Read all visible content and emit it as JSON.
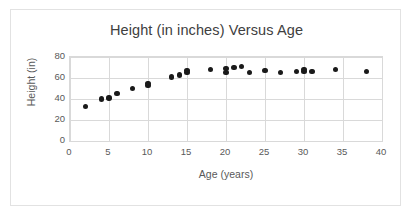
{
  "chart_data": {
    "type": "scatter",
    "title": "Height (in inches) Versus Age",
    "xlabel": "Age (years)",
    "ylabel": "Height (in)",
    "xlim": [
      0,
      40
    ],
    "ylim": [
      0,
      80
    ],
    "xticks": [
      0,
      5,
      10,
      15,
      20,
      25,
      30,
      35,
      40
    ],
    "yticks": [
      0,
      20,
      40,
      60,
      80
    ],
    "grid": true,
    "legend": false,
    "point_color": "#1a1a1a",
    "series": [
      {
        "name": "Height vs Age",
        "points": [
          {
            "x": 2,
            "y": 33
          },
          {
            "x": 4,
            "y": 40
          },
          {
            "x": 5,
            "y": 41
          },
          {
            "x": 6,
            "y": 45
          },
          {
            "x": 8,
            "y": 50
          },
          {
            "x": 10,
            "y": 53
          },
          {
            "x": 10,
            "y": 55
          },
          {
            "x": 13,
            "y": 61
          },
          {
            "x": 14,
            "y": 63
          },
          {
            "x": 15,
            "y": 65
          },
          {
            "x": 15,
            "y": 67
          },
          {
            "x": 18,
            "y": 68
          },
          {
            "x": 20,
            "y": 65
          },
          {
            "x": 20,
            "y": 69
          },
          {
            "x": 21,
            "y": 70
          },
          {
            "x": 22,
            "y": 71
          },
          {
            "x": 23,
            "y": 65
          },
          {
            "x": 25,
            "y": 67
          },
          {
            "x": 27,
            "y": 65
          },
          {
            "x": 29,
            "y": 66
          },
          {
            "x": 30,
            "y": 66
          },
          {
            "x": 30,
            "y": 68
          },
          {
            "x": 31,
            "y": 66
          },
          {
            "x": 34,
            "y": 68
          },
          {
            "x": 38,
            "y": 66
          }
        ]
      }
    ]
  }
}
